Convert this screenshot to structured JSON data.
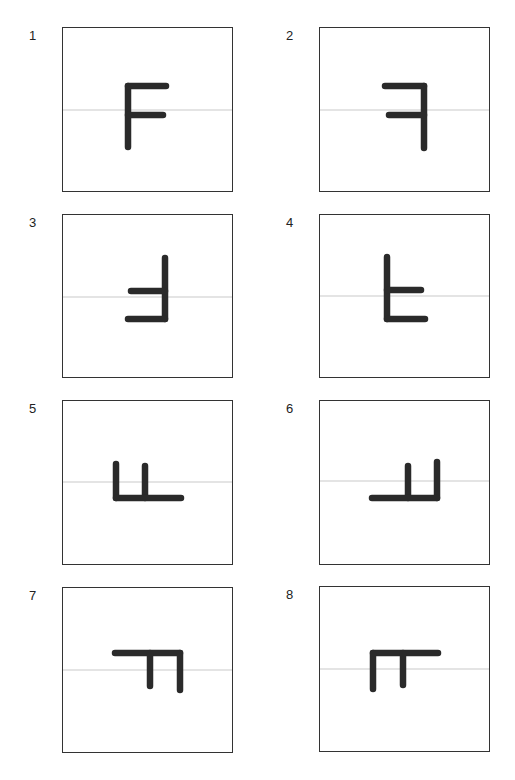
{
  "figure": {
    "stroke_color": "#2a2a2a",
    "guide_color": "#bbbbbb",
    "border_color": "#333333",
    "panels": [
      {
        "label": "1",
        "orientation": "F upright",
        "box": [
          62,
          27,
          171,
          165
        ],
        "guide_y": 110,
        "strokes": [
          [
            128,
            86,
            128,
            147
          ],
          [
            128,
            86,
            166,
            86
          ],
          [
            128,
            115,
            163,
            115
          ]
        ]
      },
      {
        "label": "2",
        "orientation": "F mirrored horizontally",
        "box": [
          319,
          27,
          171,
          165
        ],
        "guide_y": 110,
        "strokes": [
          [
            424,
            86,
            424,
            148
          ],
          [
            385,
            86,
            424,
            86
          ],
          [
            389,
            115,
            424,
            115
          ]
        ]
      },
      {
        "label": "3",
        "orientation": "F rotated 180° / mirrored vertically",
        "box": [
          62,
          214,
          171,
          164
        ],
        "guide_y": 297,
        "strokes": [
          [
            165,
            258,
            165,
            319
          ],
          [
            131,
            291,
            165,
            291
          ],
          [
            128,
            319,
            165,
            319
          ]
        ]
      },
      {
        "label": "4",
        "orientation": "F mirrored vertically",
        "box": [
          319,
          214,
          171,
          164
        ],
        "guide_y": 296,
        "strokes": [
          [
            387,
            257,
            387,
            319
          ],
          [
            387,
            290,
            421,
            290
          ],
          [
            387,
            319,
            425,
            319
          ]
        ]
      },
      {
        "label": "5",
        "orientation": "F rotated 90° counter-clockwise",
        "box": [
          62,
          400,
          171,
          165
        ],
        "guide_y": 482,
        "strokes": [
          [
            116,
            464,
            116,
            498
          ],
          [
            145,
            466,
            145,
            498
          ],
          [
            116,
            498,
            181,
            498
          ]
        ]
      },
      {
        "label": "6",
        "orientation": "F rotated 90° counter-clockwise, mirrored",
        "box": [
          319,
          400,
          171,
          165
        ],
        "guide_y": 481,
        "strokes": [
          [
            437,
            462,
            437,
            498
          ],
          [
            408,
            466,
            408,
            498
          ],
          [
            372,
            498,
            437,
            498
          ]
        ]
      },
      {
        "label": "7",
        "orientation": "F rotated 90° clockwise",
        "box": [
          62,
          587,
          171,
          166
        ],
        "guide_y": 670,
        "strokes": [
          [
            115,
            653,
            180,
            653
          ],
          [
            180,
            653,
            180,
            690
          ],
          [
            150,
            653,
            150,
            686
          ]
        ]
      },
      {
        "label": "8",
        "orientation": "F rotated 90° clockwise, mirrored",
        "box": [
          319,
          586,
          171,
          166
        ],
        "guide_y": 669,
        "strokes": [
          [
            373,
            653,
            438,
            653
          ],
          [
            373,
            653,
            373,
            689
          ],
          [
            403,
            653,
            403,
            685
          ]
        ]
      }
    ]
  }
}
